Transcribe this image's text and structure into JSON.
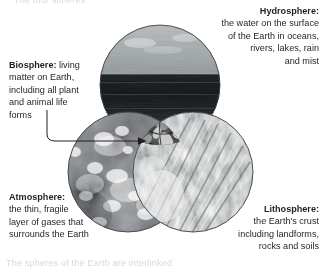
{
  "page": {
    "background_color": "#ffffff",
    "text_color": "#231f20",
    "cropped_text_top": "The four spheres",
    "cropped_text_bottom": "The spheres of the Earth are interlinked"
  },
  "labels": {
    "hydrosphere": {
      "term": "Hydrosphere",
      "colon": ":",
      "lines": [
        "the water on the surface",
        "of the Earth in oceans,",
        "rivers, lakes, rain",
        "and mist"
      ],
      "align": "right"
    },
    "biosphere": {
      "term": "Biosphere",
      "colon": ":",
      "first_line_rest": " living",
      "lines": [
        "matter on Earth,",
        "including all plant",
        "and animal life",
        "forms"
      ],
      "align": "left"
    },
    "atmosphere": {
      "term": "Atmosphere",
      "colon": ":",
      "lines": [
        "the thin, fragile",
        "layer of gases that",
        "surrounds the Earth"
      ],
      "align": "left"
    },
    "lithosphere": {
      "term": "Lithosphere",
      "colon": ":",
      "lines": [
        "the Earth's crust",
        "including landforms,",
        "rocks and soils"
      ],
      "align": "right"
    }
  },
  "venn": {
    "circles": [
      {
        "name": "hydrosphere",
        "cx": 160,
        "cy": 85,
        "r": 60,
        "fill_description": "sea-and-sky photograph",
        "stroke": "#4a4a4a"
      },
      {
        "name": "atmosphere",
        "cx": 128,
        "cy": 172,
        "r": 60,
        "fill_description": "clouds photograph",
        "stroke": "#4a4a4a"
      },
      {
        "name": "lithosphere",
        "cx": 193,
        "cy": 172,
        "r": 60,
        "fill_description": "rock-crust photograph",
        "stroke": "#4a4a4a"
      }
    ],
    "center_intersection": {
      "name": "biosphere",
      "fill_description": "dark foliage / leaf photograph"
    },
    "arrow": {
      "name": "biosphere-pointer",
      "from_x": 47,
      "from_y": 110,
      "to_x": 143,
      "to_y": 141,
      "color": "#231f20"
    }
  }
}
